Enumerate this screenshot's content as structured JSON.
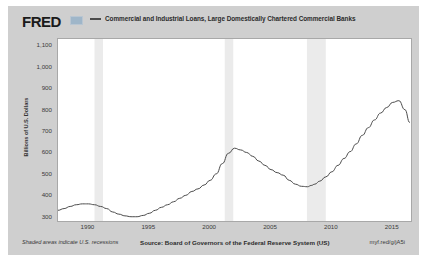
{
  "header": {
    "logo": "FRED",
    "logo_mark": "fred-graph-mark",
    "legend_label": "Commercial and Industrial Loans, Large Domestically Chartered Commercial Banks"
  },
  "footer": {
    "recession_note": "Shaded areas indicate U.S. recessions",
    "source": "Source: Board of Governors of the Federal Reserve System (US)",
    "short_url": "myf.red/g/jA5i"
  },
  "colors": {
    "page_background": "#ffffff",
    "chart_background": "#cfcfcf",
    "plot_background": "#ffffff",
    "series_line": "#4b4b4b",
    "recession_band": "#ebebeb",
    "plot_border": "#a8a8a8",
    "text": "#3a3a3a",
    "logo": "#1a1a1a",
    "logo_mark": "#9fb6c9"
  },
  "chart_data": {
    "type": "line",
    "title": "Commercial and Industrial Loans, Large Domestically Chartered Commercial Banks",
    "xlabel": "",
    "ylabel": "Billions of U.S. Dollars",
    "xlim": [
      1987.5,
      2016.5
    ],
    "ylim": [
      280,
      1130
    ],
    "yticks": [
      300,
      400,
      500,
      600,
      700,
      800,
      900,
      1000,
      1100
    ],
    "ytick_labels": [
      "300",
      "400",
      "500",
      "600",
      "700",
      "800",
      "900",
      "1,000",
      "1,100"
    ],
    "xticks": [
      1990,
      1995,
      2000,
      2005,
      2010,
      2015
    ],
    "xtick_labels": [
      "1990",
      "1995",
      "2000",
      "2005",
      "2010",
      "2015"
    ],
    "grid": false,
    "legend_position": "top",
    "recession_bands": [
      {
        "start": 1990.5,
        "end": 1991.2
      },
      {
        "start": 2001.2,
        "end": 2001.9
      },
      {
        "start": 2007.95,
        "end": 2009.5
      }
    ],
    "series": [
      {
        "name": "Commercial and Industrial Loans, Large Domestically Chartered Commercial Banks",
        "color": "#4b4b4b",
        "x": [
          1987.5,
          1988.0,
          1988.5,
          1989.0,
          1989.5,
          1990.0,
          1990.5,
          1991.0,
          1991.5,
          1992.0,
          1992.5,
          1993.0,
          1993.5,
          1994.0,
          1994.5,
          1995.0,
          1995.5,
          1996.0,
          1996.5,
          1997.0,
          1997.5,
          1998.0,
          1998.5,
          1999.0,
          1999.5,
          2000.0,
          2000.5,
          2001.0,
          2001.5,
          2002.0,
          2002.5,
          2003.0,
          2003.5,
          2004.0,
          2004.5,
          2005.0,
          2005.5,
          2006.0,
          2006.5,
          2007.0,
          2007.5,
          2008.0,
          2008.3,
          2008.6,
          2009.0,
          2009.5,
          2010.0,
          2010.5,
          2011.0,
          2011.5,
          2012.0,
          2012.5,
          2013.0,
          2013.5,
          2014.0,
          2014.5,
          2015.0,
          2015.5,
          2016.0,
          2016.4
        ],
        "values": [
          330,
          338,
          348,
          356,
          360,
          360,
          356,
          348,
          338,
          322,
          312,
          304,
          300,
          300,
          306,
          316,
          330,
          344,
          356,
          370,
          386,
          400,
          418,
          430,
          448,
          470,
          500,
          548,
          596,
          620,
          612,
          600,
          582,
          560,
          540,
          520,
          506,
          494,
          470,
          452,
          442,
          440,
          446,
          452,
          466,
          486,
          510,
          540,
          572,
          604,
          640,
          680,
          716,
          752,
          784,
          810,
          834,
          842,
          800,
          740
        ]
      }
    ],
    "annotations": [
      {
        "label": "2008 peak",
        "x": 2008.6,
        "y": 842
      },
      {
        "label": "2010 trough",
        "x": 2010.6,
        "y": 600
      },
      {
        "label": "2016 level",
        "x": 2016.4,
        "y": 1080
      }
    ]
  }
}
